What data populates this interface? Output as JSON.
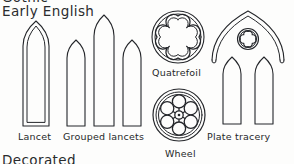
{
  "page": {
    "background_color": "#fdfdfc",
    "ink_color": "#24262a",
    "width": 294,
    "height": 164
  },
  "headings": {
    "above_clipped": "Gothic",
    "current": "Early English",
    "below_clipped": "Decorated"
  },
  "figures": [
    {
      "id": "lancet",
      "label": "Lancet",
      "description": "single tall pointed arch window with double outline"
    },
    {
      "id": "grouped-lancets",
      "label": "Grouped lancets",
      "description": "three pointed arch windows, taller center light"
    },
    {
      "id": "quatrefoil",
      "label": "Quatrefoil",
      "description": "four-lobed opening within a double ring circle"
    },
    {
      "id": "wheel",
      "label": "Wheel",
      "description": "circular window with six lobes and spokes around a central hub"
    },
    {
      "id": "plate-tracery",
      "label": "Plate tracery",
      "description": "pointed containing arch over two lancets with a small quatrefoil circle above"
    }
  ]
}
